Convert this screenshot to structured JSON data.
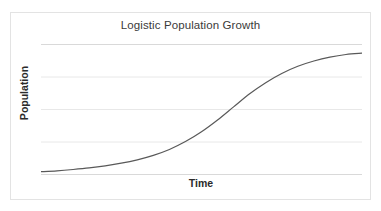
{
  "chart_data": {
    "type": "line",
    "title": "Logistic Population Growth",
    "xlabel": "Time",
    "ylabel": "Population",
    "grid": true,
    "gridlines_horizontal": 5,
    "legend": null,
    "xticklabels": [],
    "yticklabels": [],
    "xlim": [
      0,
      100
    ],
    "ylim": [
      0,
      100
    ],
    "series": [
      {
        "name": "Logistic growth",
        "color": "#595959",
        "x": [
          0,
          5,
          10,
          15,
          20,
          25,
          30,
          35,
          40,
          45,
          50,
          55,
          60,
          65,
          70,
          75,
          80,
          85,
          90,
          95,
          100
        ],
        "y": [
          2.5,
          3.2,
          4.2,
          5.4,
          7.0,
          9.0,
          11.6,
          15.0,
          19.5,
          25.5,
          33.0,
          42.0,
          52.0,
          62.0,
          70.5,
          77.5,
          83.0,
          87.0,
          90.0,
          92.0,
          93.0
        ]
      }
    ]
  },
  "chart": {
    "title": "Logistic Population Growth",
    "y_axis_label": "Population",
    "x_axis_label": "Time"
  },
  "colors": {
    "curve": "#595959",
    "gridline": "#e8e8e8",
    "axis": "#d9d9d9",
    "frame": "#e3e3e3",
    "title_text": "#3a3a3a",
    "axis_label_text": "#2b2b2b",
    "background": "#ffffff"
  }
}
